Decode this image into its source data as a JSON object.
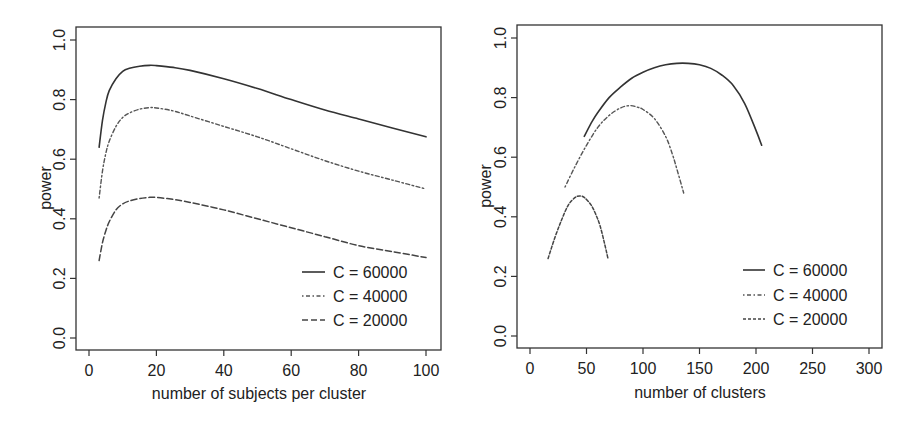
{
  "chart_data": [
    {
      "type": "line",
      "title": "",
      "xlabel": "number of subjects per cluster",
      "ylabel": "power",
      "xlim": [
        0,
        100
      ],
      "ylim": [
        0.0,
        1.0
      ],
      "xticks": [
        0,
        20,
        40,
        60,
        80,
        100
      ],
      "xtick_labels": [
        "0",
        "20",
        "40",
        "60",
        "80",
        "100"
      ],
      "yticks": [
        0.0,
        0.2,
        0.4,
        0.6,
        0.8,
        1.0
      ],
      "ytick_labels": [
        "0.0",
        "0.2",
        "0.4",
        "0.6",
        "0.8",
        "1.0"
      ],
      "grid": false,
      "legend_position": "bottom-right",
      "series": [
        {
          "name": "C = 60000",
          "style": "solid",
          "color": "#333333",
          "x": [
            3,
            4,
            5,
            6,
            8,
            10,
            12,
            15,
            18,
            20,
            25,
            30,
            40,
            50,
            60,
            70,
            80,
            90,
            100
          ],
          "y": [
            0.64,
            0.73,
            0.79,
            0.83,
            0.87,
            0.895,
            0.905,
            0.912,
            0.915,
            0.914,
            0.908,
            0.898,
            0.87,
            0.837,
            0.8,
            0.765,
            0.735,
            0.705,
            0.675
          ]
        },
        {
          "name": "C = 40000",
          "style": "dotdash",
          "color": "#555555",
          "x": [
            3,
            4,
            5,
            6,
            8,
            10,
            12,
            15,
            18,
            20,
            25,
            30,
            40,
            50,
            60,
            70,
            80,
            90,
            100
          ],
          "y": [
            0.47,
            0.56,
            0.62,
            0.66,
            0.71,
            0.74,
            0.755,
            0.768,
            0.773,
            0.772,
            0.762,
            0.745,
            0.71,
            0.675,
            0.635,
            0.595,
            0.56,
            0.53,
            0.5
          ]
        },
        {
          "name": "C = 20000",
          "style": "longdash",
          "color": "#444444",
          "x": [
            3,
            4,
            5,
            6,
            8,
            10,
            12,
            15,
            18,
            20,
            25,
            30,
            40,
            50,
            60,
            70,
            80,
            90,
            100
          ],
          "y": [
            0.26,
            0.32,
            0.36,
            0.39,
            0.43,
            0.45,
            0.46,
            0.468,
            0.472,
            0.472,
            0.465,
            0.455,
            0.43,
            0.4,
            0.37,
            0.34,
            0.31,
            0.29,
            0.27
          ]
        }
      ]
    },
    {
      "type": "line",
      "title": "",
      "xlabel": "number of clusters",
      "ylabel": "power",
      "xlim": [
        0,
        300
      ],
      "ylim": [
        0.0,
        1.0
      ],
      "xticks": [
        0,
        50,
        100,
        150,
        200,
        250,
        300
      ],
      "xtick_labels": [
        "0",
        "50",
        "100",
        "150",
        "200",
        "250",
        "300"
      ],
      "yticks": [
        0.0,
        0.2,
        0.4,
        0.6,
        0.8,
        1.0
      ],
      "ytick_labels": [
        "0.0",
        "0.2",
        "0.4",
        "0.6",
        "0.8",
        "1.0"
      ],
      "grid": false,
      "legend_position": "bottom-right",
      "series": [
        {
          "name": "C = 60000",
          "style": "solid",
          "color": "#333333",
          "x": [
            48,
            55,
            60,
            70,
            80,
            90,
            100,
            110,
            120,
            130,
            140,
            150,
            160,
            170,
            180,
            190,
            200,
            205
          ],
          "y": [
            0.67,
            0.72,
            0.75,
            0.8,
            0.835,
            0.865,
            0.885,
            0.9,
            0.91,
            0.915,
            0.915,
            0.91,
            0.898,
            0.875,
            0.84,
            0.78,
            0.69,
            0.64
          ]
        },
        {
          "name": "C = 40000",
          "style": "dotdash",
          "color": "#555555",
          "x": [
            31,
            40,
            50,
            60,
            70,
            80,
            88,
            95,
            100,
            110,
            120,
            126,
            130,
            136
          ],
          "y": [
            0.5,
            0.57,
            0.64,
            0.7,
            0.74,
            0.765,
            0.773,
            0.768,
            0.76,
            0.73,
            0.67,
            0.61,
            0.56,
            0.48
          ]
        },
        {
          "name": "C = 20000",
          "style": "shortdash",
          "color": "#444444",
          "x": [
            16,
            22,
            28,
            34,
            40,
            44,
            48,
            54,
            58,
            62,
            66,
            69
          ],
          "y": [
            0.26,
            0.33,
            0.39,
            0.44,
            0.465,
            0.47,
            0.465,
            0.44,
            0.41,
            0.37,
            0.31,
            0.26
          ]
        }
      ]
    }
  ],
  "panels": {
    "left": {
      "ylabel": "power",
      "xlabel": "number of subjects per cluster",
      "legend": [
        "C = 60000",
        "C = 40000",
        "C = 20000"
      ]
    },
    "right": {
      "ylabel": "power",
      "xlabel": "number of clusters",
      "legend": [
        "C = 60000",
        "C = 40000",
        "C = 20000"
      ]
    }
  }
}
